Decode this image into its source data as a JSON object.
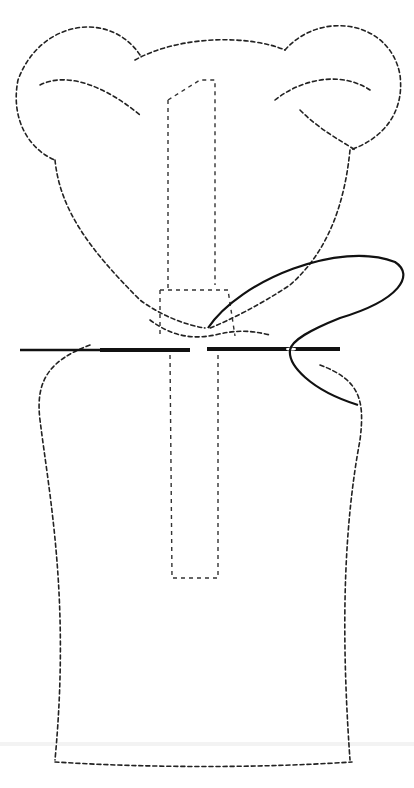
{
  "figure": {
    "colors": {
      "background": "#ffffff",
      "ink": "#111111"
    },
    "elements": [
      "fur-outline",
      "left-ear",
      "right-ear",
      "dowel-guide",
      "needle",
      "thread-loop"
    ]
  }
}
